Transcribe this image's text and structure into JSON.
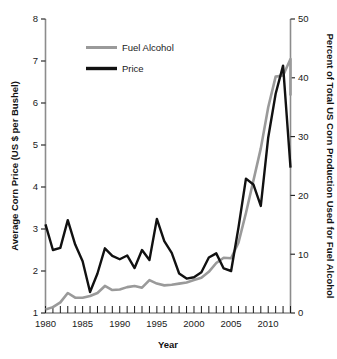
{
  "chart_data": {
    "type": "line",
    "title": "",
    "xlabel": "Year",
    "ylabel": "Average Corn Price (US $ per Bushel)",
    "y2label": "Percent of Total US Corn Production Used for Fuel Alcohol",
    "xlim": [
      1980,
      2013
    ],
    "ylim": [
      1,
      8
    ],
    "y2lim": [
      0,
      50
    ],
    "grid": false,
    "legend_position": "top-left-inside",
    "x_tick_labels": [
      "1980",
      "1985",
      "1990",
      "1995",
      "2000",
      "2005",
      "2010"
    ],
    "x_major_ticks": [
      1980,
      1985,
      1990,
      1995,
      2000,
      2005,
      2010
    ],
    "x_minor_ticks_every": 1,
    "y_tick_labels": [
      "1",
      "2",
      "3",
      "4",
      "5",
      "6",
      "7",
      "8"
    ],
    "y_ticks": [
      1,
      2,
      3,
      4,
      5,
      6,
      7,
      8
    ],
    "y2_tick_labels": [
      "0",
      "10",
      "20",
      "30",
      "40",
      "50"
    ],
    "y2_ticks": [
      0,
      10,
      20,
      30,
      40,
      50
    ],
    "x": [
      1980,
      1981,
      1982,
      1983,
      1984,
      1985,
      1986,
      1987,
      1988,
      1989,
      1990,
      1991,
      1992,
      1993,
      1994,
      1995,
      1996,
      1997,
      1998,
      1999,
      2000,
      2001,
      2002,
      2003,
      2004,
      2005,
      2006,
      2007,
      2008,
      2009,
      2010,
      2011,
      2012,
      2013
    ],
    "series": [
      {
        "name": "Fuel Alcohol",
        "color": "#9a9a9a",
        "axis": "right",
        "unit": "percent",
        "values": [
          0.6,
          1.0,
          1.8,
          3.4,
          2.6,
          2.6,
          2.9,
          3.4,
          4.6,
          3.9,
          4.0,
          4.4,
          4.6,
          4.3,
          5.6,
          5.0,
          4.7,
          4.8,
          5.0,
          5.2,
          5.6,
          6.0,
          7.0,
          8.5,
          9.4,
          9.3,
          12.0,
          17.0,
          22.5,
          28.0,
          35.0,
          40.2,
          40.4,
          43.2
        ]
      },
      {
        "name": "Price",
        "color": "#111111",
        "axis": "left",
        "unit": "usd_per_bushel",
        "values": [
          3.11,
          2.5,
          2.55,
          3.21,
          2.63,
          2.23,
          1.5,
          1.94,
          2.54,
          2.36,
          2.28,
          2.37,
          2.07,
          2.5,
          2.26,
          3.24,
          2.71,
          2.43,
          1.94,
          1.82,
          1.85,
          1.97,
          2.32,
          2.42,
          2.06,
          2.0,
          3.04,
          4.2,
          4.06,
          3.55,
          5.18,
          6.22,
          6.89,
          4.46
        ]
      }
    ],
    "series_right_tail": {
      "fuel_alcohol_last_value": 37.0,
      "note": "gray line descends from peak at final point"
    }
  },
  "legend": {
    "items": [
      {
        "label": "Fuel Alcohol",
        "color": "#9a9a9a"
      },
      {
        "label": "Price",
        "color": "#111111"
      }
    ]
  },
  "axes": {
    "left_title": "Average Corn Price (US $ per Bushel)",
    "right_title": "Percent of Total US Corn Production Used for Fuel Alcohol",
    "bottom_title": "Year"
  }
}
